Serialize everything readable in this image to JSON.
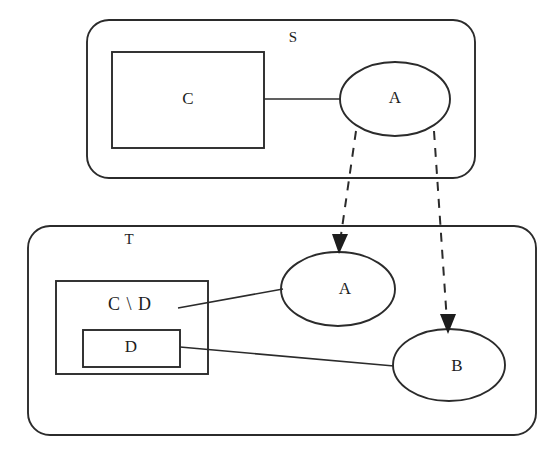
{
  "diagram": {
    "type": "set-refinement-mapping-diagram",
    "canvas": {
      "width": 559,
      "height": 458,
      "background": "#ffffff"
    },
    "stroke_color": "#2b2b2b",
    "text_color": "#1d1d1d",
    "containers": [
      {
        "id": "S",
        "label": "S",
        "shape": "rounded-rectangle",
        "x": 87,
        "y": 20,
        "width": 388,
        "height": 158,
        "radius": 22,
        "label_x": 293,
        "label_y": 39
      },
      {
        "id": "T",
        "label": "T",
        "shape": "rounded-rectangle",
        "x": 28,
        "y": 226,
        "width": 508,
        "height": 209,
        "radius": 22,
        "label_x": 129,
        "label_y": 241
      }
    ],
    "boxes": [
      {
        "id": "C",
        "label": "C",
        "shape": "rectangle",
        "x": 112,
        "y": 52,
        "width": 152,
        "height": 96,
        "label_x": 188,
        "label_y": 100
      },
      {
        "id": "CminusD",
        "label": "C \\ D",
        "shape": "rectangle",
        "x": 56,
        "y": 281,
        "width": 152,
        "height": 93,
        "label_x": 130,
        "label_y": 306
      },
      {
        "id": "D",
        "label": "D",
        "shape": "rectangle",
        "x": 83,
        "y": 330,
        "width": 97,
        "height": 37,
        "label_x": 131,
        "label_y": 348
      }
    ],
    "ellipses": [
      {
        "id": "A-in-S",
        "label": "A",
        "cx": 395,
        "cy": 99,
        "rx": 55,
        "ry": 37,
        "label_x": 395,
        "label_y": 99
      },
      {
        "id": "A-in-T",
        "label": "A",
        "cx": 338,
        "cy": 289,
        "rx": 57,
        "ry": 37,
        "label_x": 345,
        "label_y": 290
      },
      {
        "id": "B-in-T",
        "label": "B",
        "cx": 449,
        "cy": 365,
        "rx": 56,
        "ry": 36,
        "label_x": 457,
        "label_y": 367
      }
    ],
    "solid_links": [
      {
        "id": "link-C-to-A",
        "from": "C",
        "to": "A-in-S",
        "x1": 264,
        "y1": 99,
        "x2": 341,
        "y2": 99
      },
      {
        "id": "link-CminusD-to-A",
        "from": "CminusD",
        "to": "A-in-T",
        "x1": 178,
        "y1": 308,
        "x2": 283,
        "y2": 289
      },
      {
        "id": "link-D-to-B",
        "from": "D",
        "to": "B-in-T",
        "x1": 180,
        "y1": 347,
        "x2": 394,
        "y2": 366
      }
    ],
    "dashed_arrows": [
      {
        "id": "arrow-A-to-A",
        "from": "A-in-S",
        "to": "A-in-T",
        "x1": 356,
        "y1": 131,
        "x2": 339,
        "y2": 247,
        "style": "dashed",
        "arrowhead": "filled-triangle"
      },
      {
        "id": "arrow-A-to-B",
        "from": "A-in-S",
        "to": "B-in-T",
        "x1": 434,
        "y1": 131,
        "x2": 448,
        "y2": 327,
        "style": "dashed",
        "arrowhead": "filled-triangle"
      }
    ]
  }
}
